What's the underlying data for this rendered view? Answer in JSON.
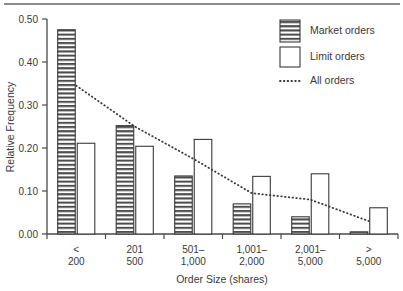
{
  "chart_data": {
    "type": "bar",
    "title": "",
    "xlabel": "Order Size (shares)",
    "ylabel": "Relative Frequency",
    "categories": [
      "< 200",
      "201 500",
      "501– 1,000",
      "1,001– 2,000",
      "2,001– 5,000",
      "> 5,000"
    ],
    "category_lines": [
      [
        "<",
        "200"
      ],
      [
        "201",
        "500"
      ],
      [
        "501–",
        "1,000"
      ],
      [
        "1,001–",
        "2,000"
      ],
      [
        "2,001–",
        "5,000"
      ],
      [
        ">",
        "5,000"
      ]
    ],
    "ylim": [
      0.0,
      0.5
    ],
    "yticks": [
      0.0,
      0.1,
      0.2,
      0.3,
      0.4,
      0.5
    ],
    "ytick_labels": [
      "0.00",
      "0.10",
      "0.20",
      "0.30",
      "0.40",
      "0.50"
    ],
    "grid": false,
    "legend_position": "top-right",
    "series": [
      {
        "name": "Market orders",
        "kind": "bar",
        "style": "horizontal-hatch",
        "values": [
          0.475,
          0.252,
          0.135,
          0.07,
          0.04,
          0.005
        ]
      },
      {
        "name": "Limit orders",
        "kind": "bar",
        "style": "white-fill",
        "values": [
          0.211,
          0.204,
          0.22,
          0.134,
          0.14,
          0.061
        ]
      },
      {
        "name": "All orders",
        "kind": "line",
        "style": "dotted",
        "values": [
          0.345,
          0.25,
          0.175,
          0.095,
          0.08,
          0.03
        ]
      }
    ]
  },
  "legend": {
    "items": [
      {
        "label": "Market orders",
        "swatch": "hatched-box"
      },
      {
        "label": "Limit orders",
        "swatch": "white-box"
      },
      {
        "label": "All orders",
        "swatch": "dotted-line"
      }
    ]
  },
  "colors": {
    "ink": "#3a3a3a",
    "axis": "#4a4a4a",
    "hatch": "#4d4d4d",
    "background": "#ffffff",
    "rule": "#8a8a8a"
  }
}
